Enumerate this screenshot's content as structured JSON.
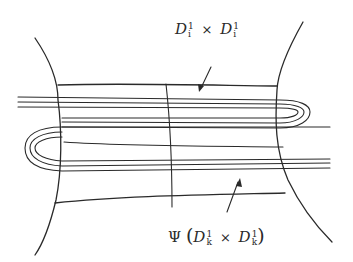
{
  "figure": {
    "type": "hand-drawn topology diagram",
    "colors": {
      "ink": "#2a2a2a",
      "background": "#ffffff"
    }
  },
  "labels": {
    "top": {
      "base1": "D",
      "sup1": "1",
      "sub1": "i",
      "times": "×",
      "base2": "D",
      "sup2": "1",
      "sub2": "i"
    },
    "bottom": {
      "psi": "Ψ",
      "open": "(",
      "base1": "D",
      "sup1": "1",
      "sub1": "k",
      "times": "×",
      "base2": "D",
      "sup2": "1",
      "sub2": "k",
      "close": ")"
    }
  }
}
